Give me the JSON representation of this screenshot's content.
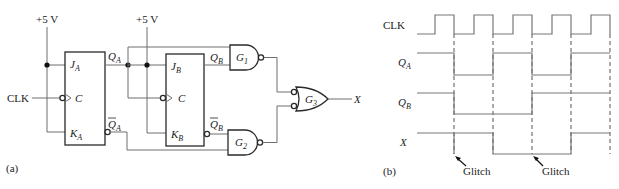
{
  "circuit": {
    "panel_label": "(a)",
    "vcc_label_a": "+5 V",
    "vcc_label_b": "+5 V",
    "clk_label": "CLK",
    "ff_a": {
      "j": "J",
      "j_sub": "A",
      "c": "C",
      "k": "K",
      "k_sub": "A",
      "q": "Q",
      "q_sub": "A",
      "qbar": "Q",
      "qbar_sub": "A"
    },
    "ff_b": {
      "j": "J",
      "j_sub": "B",
      "c": "C",
      "k": "K",
      "k_sub": "B",
      "q": "Q",
      "q_sub": "B",
      "qbar": "Q",
      "qbar_sub": "B"
    },
    "gates": [
      {
        "id": "G1",
        "label": "G",
        "sub": "1",
        "type": "NAND"
      },
      {
        "id": "G2",
        "label": "G",
        "sub": "2",
        "type": "NAND"
      },
      {
        "id": "G3",
        "label": "G",
        "sub": "3",
        "type": "OR (negated inputs)"
      }
    ],
    "output_label": "X"
  },
  "timing": {
    "panel_label": "(b)",
    "signals": [
      {
        "name": "CLK",
        "sub": ""
      },
      {
        "name": "Q",
        "sub": "A"
      },
      {
        "name": "Q",
        "sub": "B"
      },
      {
        "name": "X",
        "sub": ""
      }
    ],
    "annotations": [
      "Glitch",
      "Glitch"
    ]
  }
}
